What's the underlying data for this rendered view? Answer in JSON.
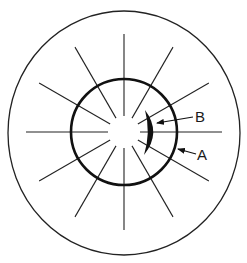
{
  "diagram": {
    "type": "radial-keratotomy-style schematic",
    "colors": {
      "background": "#ffffff",
      "stroke": "#222222",
      "inner_stroke": "#111111",
      "crescent_fill": "#111111"
    },
    "center": [
      124,
      132
    ],
    "outer_circle": {
      "rx": 116,
      "ry": 122,
      "stroke_width": 1.3
    },
    "inner_circle": {
      "r": 53,
      "stroke_width": 2.6
    },
    "rays": {
      "count": 12,
      "inner_radius": 16,
      "outer_radius": 98,
      "step_deg": 30,
      "stroke_width": 1.1
    },
    "crescent": {
      "top": [
        145,
        110
      ],
      "bottom": [
        144,
        155
      ],
      "outer_bulge_x": 156,
      "inner_bulge_x": 149
    },
    "labels": [
      {
        "id": "B",
        "text": "B",
        "x": 195,
        "y": 122,
        "arrow_from": [
          193,
          117
        ],
        "arrow_to": [
          157,
          123
        ]
      },
      {
        "id": "A",
        "text": "A",
        "x": 197,
        "y": 160,
        "arrow_from": [
          196,
          154
        ],
        "arrow_to": [
          178,
          149
        ]
      }
    ]
  }
}
